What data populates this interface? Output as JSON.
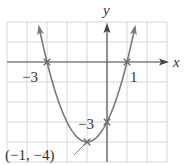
{
  "chart_data": {
    "type": "line",
    "title": "",
    "function": "y = (x + 1)^2 - 4",
    "xlabel": "x",
    "ylabel": "y",
    "xlim": [
      -5,
      3
    ],
    "ylim": [
      -5,
      2
    ],
    "grid": true,
    "grid_step": 1,
    "series": [
      {
        "name": "parabola",
        "x": [
          -3.4,
          -3,
          -2,
          -1,
          0,
          1,
          1.4
        ],
        "y": [
          1.76,
          0,
          -3,
          -4,
          -3,
          0,
          1.76
        ]
      }
    ],
    "marked_points": [
      {
        "x": -3,
        "y": 0,
        "label": "−3"
      },
      {
        "x": 1,
        "y": 0,
        "label": "1"
      },
      {
        "x": 0,
        "y": -3,
        "label": "−3"
      },
      {
        "x": -1,
        "y": -4,
        "label": "(−1, −4)"
      }
    ]
  },
  "labels": {
    "x_axis": "x",
    "y_axis": "y",
    "x_intercept_left": "−3",
    "x_intercept_right": "1",
    "y_intercept": "−3",
    "vertex": "(−1, −4)"
  },
  "colors": {
    "grid": "#d6d6d6",
    "axis": "#555555",
    "curve": "#7a7a7a",
    "text": "#333333"
  }
}
